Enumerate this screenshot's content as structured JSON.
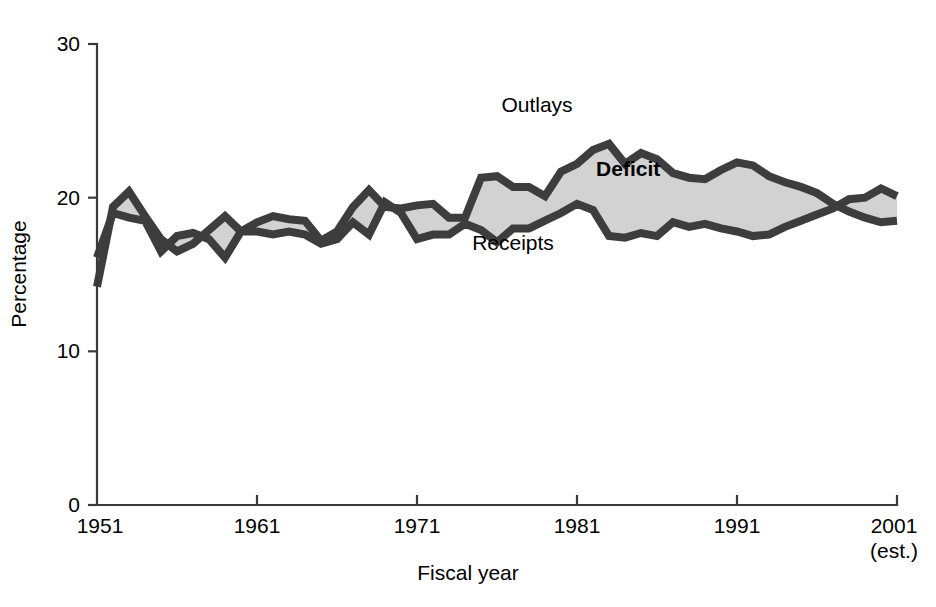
{
  "chart_data": {
    "type": "area",
    "title": "",
    "xlabel": "Fiscal year",
    "ylabel": "Percentage",
    "ylim": [
      0,
      30
    ],
    "xlim": [
      1951,
      2001
    ],
    "yticks": [
      0,
      10,
      20,
      30
    ],
    "ytick_labels": [
      "0",
      "10",
      "20",
      "30"
    ],
    "xticks": [
      1951,
      1961,
      1971,
      1981,
      1991,
      2001
    ],
    "xtick_labels": [
      "1951",
      "1961",
      "1971",
      "1981",
      "1991",
      "2001"
    ],
    "xtick_sublabels": [
      "",
      "",
      "",
      "",
      "",
      "(est.)"
    ],
    "grid": false,
    "legend": "inline-annotations",
    "annotations": [
      {
        "name": "outlays-label",
        "text": "Outlays",
        "x": 1978.5,
        "y": 25.6
      },
      {
        "name": "deficit-label",
        "text": "Deficit",
        "x": 1984.2,
        "y": 21.4
      },
      {
        "name": "receipts-label",
        "text": "Receipts",
        "x": 1977.0,
        "y": 16.6
      }
    ],
    "x": [
      1951,
      1952,
      1953,
      1954,
      1955,
      1956,
      1957,
      1958,
      1959,
      1960,
      1961,
      1962,
      1963,
      1964,
      1965,
      1966,
      1967,
      1968,
      1969,
      1970,
      1971,
      1972,
      1973,
      1974,
      1975,
      1976,
      1977,
      1978,
      1979,
      1980,
      1981,
      1982,
      1983,
      1984,
      1985,
      1986,
      1987,
      1988,
      1989,
      1990,
      1991,
      1992,
      1993,
      1994,
      1995,
      1996,
      1997,
      1998,
      1999,
      2000,
      2001
    ],
    "series": [
      {
        "name": "Outlays",
        "color": "#3d3d3d",
        "values": [
          14.2,
          19.4,
          20.4,
          18.8,
          17.3,
          16.5,
          17.0,
          17.9,
          18.8,
          17.8,
          18.4,
          18.8,
          18.6,
          18.5,
          17.2,
          17.8,
          19.4,
          20.5,
          19.4,
          19.3,
          19.5,
          19.6,
          18.7,
          18.7,
          21.3,
          21.4,
          20.7,
          20.7,
          20.1,
          21.7,
          22.2,
          23.1,
          23.5,
          22.2,
          22.9,
          22.5,
          21.6,
          21.3,
          21.2,
          21.8,
          22.3,
          22.1,
          21.4,
          21.0,
          20.7,
          20.3,
          19.6,
          19.1,
          18.7,
          18.4,
          18.5
        ]
      },
      {
        "name": "Receipts",
        "color": "#3d3d3d",
        "values": [
          16.1,
          19.0,
          18.7,
          18.5,
          16.5,
          17.5,
          17.7,
          17.3,
          16.1,
          17.8,
          17.8,
          17.6,
          17.8,
          17.6,
          17.0,
          17.3,
          18.4,
          17.6,
          19.7,
          19.0,
          17.3,
          17.6,
          17.6,
          18.3,
          17.9,
          17.1,
          18.0,
          18.0,
          18.5,
          19.0,
          19.6,
          19.2,
          17.5,
          17.4,
          17.7,
          17.5,
          18.4,
          18.1,
          18.3,
          18.0,
          17.8,
          17.5,
          17.6,
          18.1,
          18.5,
          18.9,
          19.3,
          19.9,
          20.0,
          20.6,
          20.1
        ]
      }
    ],
    "band": {
      "name": "Deficit",
      "upper_series": "Outlays",
      "lower_series": "Receipts",
      "fill_color": "#d2d2d2"
    }
  },
  "layout": {
    "plot_left": 97,
    "plot_right": 897,
    "plot_top": 44,
    "plot_bottom": 505,
    "background": "#ffffff",
    "axis_color": "#3a3a3a",
    "line_color": "#3d3d3d",
    "band_color": "#d2d2d2"
  }
}
